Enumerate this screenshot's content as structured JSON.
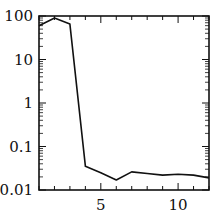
{
  "chart_data": {
    "type": "line",
    "title": "",
    "xlabel": "",
    "ylabel": "",
    "yscale": "log",
    "xlim": [
      1,
      12
    ],
    "ylim": [
      0.01,
      100
    ],
    "grid": false,
    "x_tick_labels": [
      "5",
      "10"
    ],
    "x_ticks": [
      5,
      10
    ],
    "y_tick_labels": [
      "0.01",
      "0.1",
      "1",
      "10",
      "100"
    ],
    "y_ticks": [
      0.01,
      0.1,
      1,
      10,
      100
    ],
    "series": [
      {
        "name": "series-1",
        "x": [
          1,
          2,
          3,
          4,
          5,
          6,
          7,
          8,
          9,
          10,
          11,
          12
        ],
        "values": [
          60,
          90,
          65,
          0.035,
          0.025,
          0.017,
          0.026,
          0.024,
          0.022,
          0.023,
          0.022,
          0.019
        ],
        "color": "#111111"
      }
    ]
  }
}
